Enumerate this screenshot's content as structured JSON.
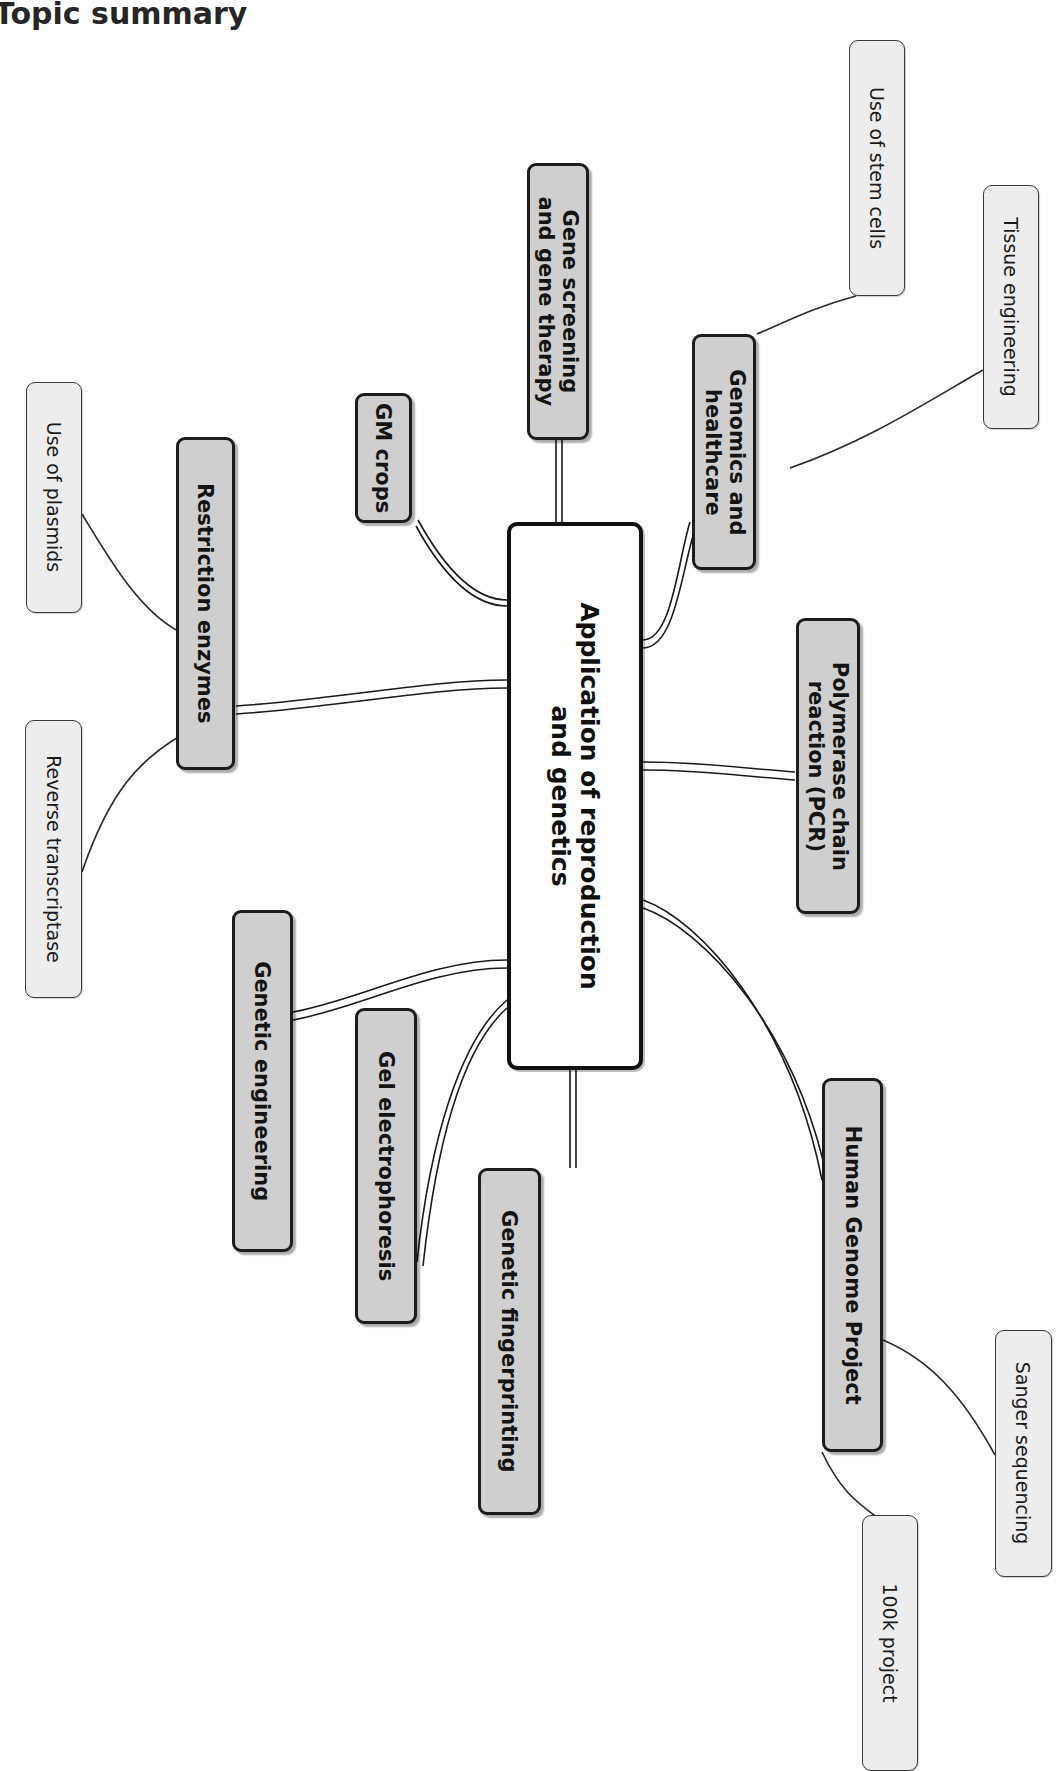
{
  "page": {
    "title": "Topic summary",
    "background": "#ffffff",
    "rotation_note": "content rendered rotated 90 degrees clockwise"
  },
  "colors": {
    "center_fill": "#ffffff",
    "center_border": "#111111",
    "branch_fill": "#cfcfcf",
    "branch_border": "#1c1c1c",
    "leaf_fill": "#ededed",
    "leaf_border": "#3a3a3a",
    "text": "#141414",
    "connector": "#1a1a1a"
  },
  "mindmap": {
    "center": {
      "label": "Application of reproduction\nand genetics"
    },
    "branches": [
      {
        "id": "gene-screening",
        "label": "Gene screening\nand gene therapy",
        "children": []
      },
      {
        "id": "gm-crops",
        "label": "GM crops",
        "children": []
      },
      {
        "id": "genomics",
        "label": "Genomics and\nhealthcare",
        "children": [
          {
            "id": "stem-cells",
            "label": "Use of stem cells"
          },
          {
            "id": "tissue-engineering",
            "label": "Tissue engineering"
          }
        ]
      },
      {
        "id": "pcr",
        "label": "Polymerase chain\nreaction (PCR)",
        "children": []
      },
      {
        "id": "restriction-enzymes",
        "label": "Restriction enzymes",
        "children": [
          {
            "id": "plasmids",
            "label": "Use of plasmids"
          },
          {
            "id": "reverse-transcriptase",
            "label": "Reverse transcriptase"
          }
        ]
      },
      {
        "id": "genetic-engineering",
        "label": "Genetic engineering",
        "children": []
      },
      {
        "id": "gel-electrophoresis",
        "label": "Gel electrophoresis",
        "children": []
      },
      {
        "id": "genetic-fingerprinting",
        "label": "Genetic fingerprinting",
        "children": []
      },
      {
        "id": "human-genome-project",
        "label": "Human Genome Project",
        "children": [
          {
            "id": "sanger-sequencing",
            "label": "Sanger sequencing"
          },
          {
            "id": "100k-project",
            "label": "100k project"
          }
        ]
      }
    ]
  }
}
